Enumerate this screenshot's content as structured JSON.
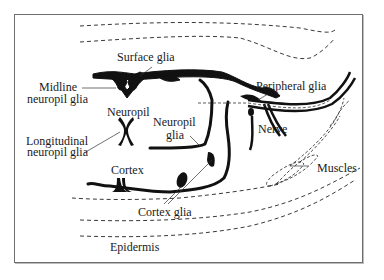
{
  "diagram": {
    "type": "anatomical-schematic",
    "labels": {
      "surface_glia": "Surface glia",
      "midline_neuropil_glia_1": "Midline",
      "midline_neuropil_glia_2": "neuropil glia",
      "neuropil": "Neuropil",
      "longitudinal_1": "Longitudinal",
      "longitudinal_2": "neuropil glia",
      "neuropil_glia_1": "Neuropil",
      "neuropil_glia_2": "glia",
      "peripheral_glia": "Peripheral glia",
      "nerve": "Nerve",
      "cortex": "Cortex",
      "cortex_glia": "Cortex glia",
      "muscles": "Muscles",
      "epidermis": "Epidermis"
    },
    "colors": {
      "ink": "#111111",
      "frame": "#6e6e6e",
      "background": "#ffffff"
    }
  }
}
